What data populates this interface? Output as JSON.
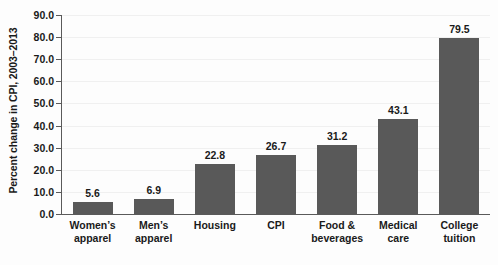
{
  "chart_data": {
    "type": "bar",
    "title": "",
    "xlabel": "",
    "ylabel": "Percent change in CPI, 2003–2013",
    "ylim": [
      0,
      90
    ],
    "ytick_step": 10,
    "grid": true,
    "legend": "none",
    "bar_color": "#595959",
    "categories": [
      "Women’s apparel",
      "Men’s apparel",
      "Housing",
      "CPI",
      "Food & beverages",
      "Medical care",
      "College tuition"
    ],
    "category_lines": [
      [
        "Women’s",
        "apparel"
      ],
      [
        "Men’s",
        "apparel"
      ],
      [
        "Housing",
        ""
      ],
      [
        "CPI",
        ""
      ],
      [
        "Food &",
        "beverages"
      ],
      [
        "Medical",
        "care"
      ],
      [
        "College",
        "tuition"
      ]
    ],
    "values": [
      5.6,
      6.9,
      22.8,
      26.7,
      31.2,
      43.1,
      79.5
    ],
    "value_labels": [
      "5.6",
      "6.9",
      "22.8",
      "26.7",
      "31.2",
      "43.1",
      "79.5"
    ],
    "ytick_labels": [
      "0.0",
      "10.0",
      "20.0",
      "30.0",
      "40.0",
      "50.0",
      "60.0",
      "70.0",
      "80.0",
      "90.0"
    ]
  },
  "colors": {
    "bar": "#595959",
    "axis": "#5a5a5a",
    "grid": "#f0f0f0",
    "text": "#1a1a1a",
    "background": "#fdfdfd"
  }
}
